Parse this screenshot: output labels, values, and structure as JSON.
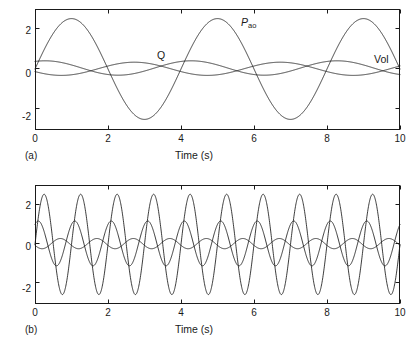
{
  "figure": {
    "background": "#ffffff",
    "line_color": "#1a1a1a"
  },
  "panels": [
    {
      "tag": "(a)",
      "xlabel": "Time (s)",
      "ylabel": "",
      "curve_labels": [
        {
          "name": "P-ao",
          "text": "P",
          "subscript": "ao",
          "italic": true
        },
        {
          "name": "Q",
          "text": "Q",
          "subscript": "",
          "italic": false
        },
        {
          "name": "Vol",
          "text": "Vol",
          "subscript": "",
          "italic": false
        }
      ]
    },
    {
      "tag": "(b)",
      "xlabel": "Time (s)",
      "ylabel": "",
      "curve_labels": []
    }
  ],
  "chart_data": [
    {
      "type": "line",
      "title": "",
      "subtitle": "",
      "panel": "(a)",
      "xlabel": "Time (s)",
      "ylabel": "",
      "xlim": [
        0,
        10
      ],
      "ylim": [
        -3.1,
        2.95
      ],
      "xticks": [
        0,
        2,
        4,
        6,
        8,
        10
      ],
      "xtick_labels": [
        "0",
        "2",
        "4",
        "6",
        "8",
        "10"
      ],
      "yticks": [
        -2,
        0,
        2
      ],
      "ytick_labels": [
        "-2",
        "0",
        "2"
      ],
      "grid": false,
      "legend": "inline-annotations",
      "frequency_hz": 0.25,
      "series": [
        {
          "name": "P_ao",
          "label": "P_ao",
          "amplitude": 2.52,
          "frequency_hz": 0.25,
          "phase_deg": 0,
          "offset": -0.05,
          "peak_times": [
            1,
            5,
            9
          ],
          "trough_times": [
            3,
            7
          ],
          "color": "#1a1a1a"
        },
        {
          "name": "Q",
          "label": "Q",
          "amplitude": 0.36,
          "frequency_hz": 0.25,
          "phase_deg": 65,
          "offset": 0.0,
          "peak_times": [
            0.28,
            4.28,
            8.28
          ],
          "trough_times": [
            2.28,
            6.28
          ],
          "color": "#1a1a1a"
        },
        {
          "name": "Vol",
          "label": "Vol",
          "amplitude": 0.33,
          "frequency_hz": 0.25,
          "phase_deg": 205,
          "offset": -0.04,
          "peak_times": [
            2.05,
            6.05
          ],
          "trough_times": [
            0.05,
            4.05,
            8.05
          ],
          "color": "#1a1a1a"
        }
      ]
    },
    {
      "type": "line",
      "title": "",
      "subtitle": "",
      "panel": "(b)",
      "xlabel": "Time (s)",
      "ylabel": "",
      "xlim": [
        0,
        10
      ],
      "ylim": [
        -3.1,
        2.95
      ],
      "xticks": [
        0,
        2,
        4,
        6,
        8,
        10
      ],
      "xtick_labels": [
        "0",
        "2",
        "4",
        "6",
        "8",
        "10"
      ],
      "yticks": [
        -2,
        0,
        2
      ],
      "ytick_labels": [
        "-2",
        "0",
        "2"
      ],
      "grid": false,
      "legend": "none",
      "frequency_hz": 1.0,
      "series": [
        {
          "name": "P_ao",
          "label": "P_ao",
          "amplitude": 2.55,
          "frequency_hz": 1.0,
          "phase_deg": 0,
          "offset": -0.07,
          "peak_times": [
            0.25,
            1.25,
            2.25,
            3.25,
            4.25,
            5.25,
            6.25,
            7.25,
            8.25,
            9.25
          ],
          "trough_times": [
            0.75,
            1.75,
            2.75,
            3.75,
            4.75,
            5.75,
            6.75,
            7.75,
            8.75,
            9.75
          ],
          "color": "#1a1a1a"
        },
        {
          "name": "Q",
          "label": "Q",
          "amplitude": 1.14,
          "frequency_hz": 1.0,
          "phase_deg": 58,
          "offset": -0.02,
          "peak_times": [
            0.28,
            1.28,
            2.28,
            3.28,
            4.28,
            5.28,
            6.28,
            7.28,
            8.28,
            9.28
          ],
          "trough_times": [
            0.78,
            1.78,
            2.78,
            3.78,
            4.78,
            5.78,
            6.78,
            7.78,
            8.78,
            9.78
          ],
          "color": "#1a1a1a"
        },
        {
          "name": "Vol",
          "label": "Vol",
          "amplitude": 0.26,
          "frequency_hz": 1.0,
          "phase_deg": 200,
          "offset": -0.03,
          "peak_times": [
            0.53,
            1.53,
            2.53,
            3.53,
            4.53,
            5.53,
            6.53,
            7.53,
            8.53,
            9.53
          ],
          "trough_times": [
            0.03,
            1.03,
            2.03,
            3.03,
            4.03,
            5.03,
            6.03,
            7.03,
            8.03,
            9.03
          ],
          "color": "#1a1a1a"
        }
      ]
    }
  ]
}
